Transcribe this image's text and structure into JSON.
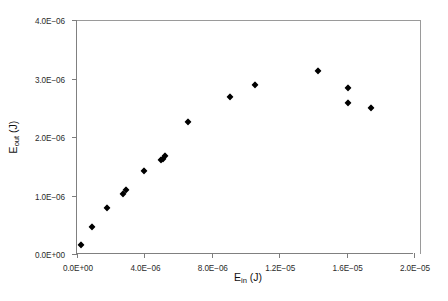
{
  "chart_data": {
    "type": "scatter",
    "title": "",
    "xlabel": "E_in (J)",
    "ylabel": "E_out (J)",
    "xlabel_base": "E",
    "xlabel_sub": "in",
    "xlabel_unit": " (J)",
    "ylabel_base": "E",
    "ylabel_sub": "out",
    "ylabel_unit": " (J)",
    "xlim": [
      0,
      2e-05
    ],
    "ylim": [
      0,
      4e-06
    ],
    "grid": false,
    "legend": "none",
    "marker": "diamond",
    "marker_color": "#000000",
    "xticklabels": [
      "0.0E+00",
      "4.0E−06",
      "8.0E−06",
      "1.2E−05",
      "1.6E−05",
      "2.0E−05"
    ],
    "xtickvalues": [
      0,
      4e-06,
      8e-06,
      1.2e-05,
      1.6e-05,
      2e-05
    ],
    "yticklabels": [
      "0.0E+00",
      "1.0E−06",
      "2.0E−06",
      "3.0E−06",
      "4.0E−06"
    ],
    "ytickvalues": [
      0,
      1e-06,
      2e-06,
      3e-06,
      4e-06
    ],
    "x": [
      2.4e-07,
      8.7e-07,
      1.78e-06,
      2.72e-06,
      2.9e-06,
      3.95e-06,
      4.99e-06,
      5.1e-06,
      5.25e-06,
      6.6e-06,
      9.1e-06,
      1.055e-05,
      1.428e-05,
      1.607e-05,
      1.607e-05,
      1.745e-05
    ],
    "y": [
      1.5e-07,
      4.7e-07,
      7.8e-07,
      1.03e-06,
      1.09e-06,
      1.42e-06,
      1.6e-06,
      1.62e-06,
      1.68e-06,
      2.26e-06,
      2.68e-06,
      2.89e-06,
      3.12e-06,
      2.84e-06,
      2.58e-06,
      2.49e-06
    ]
  }
}
